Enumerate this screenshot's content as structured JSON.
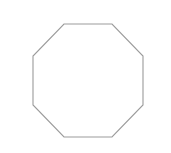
{
  "canvas": {
    "width": 171,
    "height": 153,
    "background_color": "#ffffff",
    "label": "octagon-drawing-canvas"
  },
  "shape": {
    "name": "octagon",
    "sides": 8,
    "type": "regular-polygon-outline",
    "fill_color": "#ffffff",
    "stroke_color": "#9b9b9b",
    "stroke_width": 1.1,
    "bounding_box": {
      "x": 33,
      "y": 24,
      "width": 110,
      "height": 113
    },
    "center": {
      "x": 88,
      "y": 80.5
    },
    "vertices": [
      {
        "x": 64,
        "y": 24
      },
      {
        "x": 112,
        "y": 24
      },
      {
        "x": 143,
        "y": 56
      },
      {
        "x": 143,
        "y": 105
      },
      {
        "x": 112,
        "y": 137
      },
      {
        "x": 64,
        "y": 137
      },
      {
        "x": 33,
        "y": 105
      },
      {
        "x": 33,
        "y": 56
      }
    ],
    "points_attr": "64,24 112,24 143,56 143,105 112,137 64,137 33,105 33,56"
  }
}
